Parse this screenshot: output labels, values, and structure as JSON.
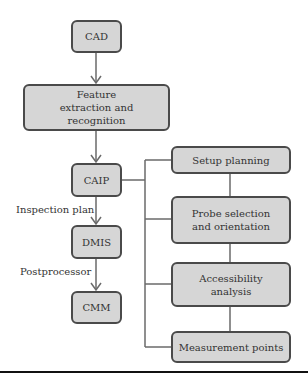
{
  "diagram": {
    "main_flow": [
      {
        "id": "cad",
        "label": "CAD"
      },
      {
        "id": "feature",
        "label": "Feature extraction and recognition"
      },
      {
        "id": "caip",
        "label": "CAIP"
      },
      {
        "id": "dmis",
        "label": "DMIS"
      },
      {
        "id": "cmm",
        "label": "CMM"
      }
    ],
    "edge_labels": {
      "caip_to_dmis": "Inspection plan",
      "dmis_to_cmm": "Postprocessor"
    },
    "caip_subtasks": [
      {
        "id": "setup",
        "label": "Setup planning"
      },
      {
        "id": "probe",
        "label": "Probe selection and orientation"
      },
      {
        "id": "access",
        "label": "Accessibility analysis"
      },
      {
        "id": "measure",
        "label": "Measurement points"
      }
    ],
    "colors": {
      "box_fill": "#d6d6d6",
      "box_border": "#4a4a4a",
      "connector": "#6a6a6a",
      "rule": "#111111"
    }
  }
}
